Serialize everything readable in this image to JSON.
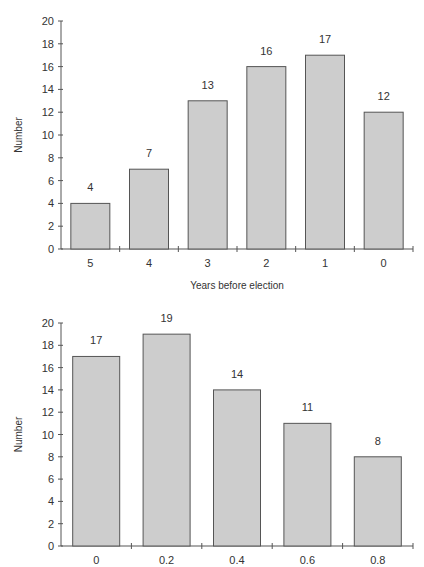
{
  "chart_data": [
    {
      "type": "bar",
      "title": "",
      "xlabel": "Years before election",
      "ylabel": "Number",
      "categories": [
        "5",
        "4",
        "3",
        "2",
        "1",
        "0"
      ],
      "values": [
        4,
        7,
        13,
        16,
        17,
        12
      ],
      "data_labels": [
        "4",
        "7",
        "13",
        "16",
        "17",
        "12"
      ],
      "ylim": [
        0,
        20
      ],
      "yticks": [
        "0",
        "2",
        "4",
        "6",
        "8",
        "10",
        "12",
        "14",
        "16",
        "18",
        "20"
      ],
      "grid": false,
      "legend": null
    },
    {
      "type": "bar",
      "title": "",
      "xlabel": "",
      "ylabel": "Number",
      "categories": [
        "0",
        "0.2",
        "0.4",
        "0.6",
        "0.8"
      ],
      "values": [
        17,
        19,
        14,
        11,
        8
      ],
      "data_labels": [
        "17",
        "19",
        "14",
        "11",
        "8"
      ],
      "ylim": [
        0,
        20
      ],
      "yticks": [
        "0",
        "2",
        "4",
        "6",
        "8",
        "10",
        "12",
        "14",
        "16",
        "18",
        "20"
      ],
      "grid": false,
      "legend": null
    }
  ],
  "colors": {
    "bar_fill": "#cdcdcd",
    "bar_stroke": "#555555",
    "axis": "#555555",
    "text": "#333333"
  }
}
